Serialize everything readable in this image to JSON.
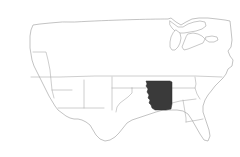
{
  "figure": {
    "kind": "choropleth-locator-map",
    "title": "Map of the contiguous United States",
    "width": 240,
    "height": 157,
    "background_color": "#ffffff"
  },
  "style": {
    "outline_color": "#9a9a9a",
    "state_border_color": "#a5a5a5",
    "highlight_fill": "#3a3a3a",
    "highlight_stroke": "#2e2e2e",
    "land_fill": "#ffffff",
    "lake_fill": "#ffffff",
    "stroke_width": 0.6
  },
  "map": {
    "region_name": "Contiguous United States",
    "projection_note": "simple planar outline",
    "highlighted": {
      "name": "Arkansas",
      "fill": "#3a3a3a",
      "bbox": [
        146,
        81,
        26,
        29
      ],
      "west_border_feature": "Mississippi River"
    },
    "features": [
      {
        "name": "national-outline",
        "type": "outline"
      },
      {
        "name": "great-lakes",
        "type": "water"
      },
      {
        "name": "interior-state-borders",
        "type": "borders"
      }
    ],
    "labels": []
  }
}
